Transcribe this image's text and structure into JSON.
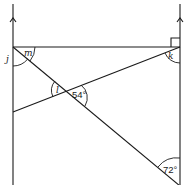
{
  "diagram": {
    "type": "geometry-angles",
    "angles": {
      "j": "j",
      "m": "m",
      "k": "k",
      "l": "l",
      "given_54": "54°",
      "given_72": "72°"
    },
    "markers": {
      "parallel_arrows": 2,
      "right_angle": "top-right corner"
    },
    "colors": {
      "stroke": "#1a1a1a",
      "background": "#ffffff"
    }
  }
}
